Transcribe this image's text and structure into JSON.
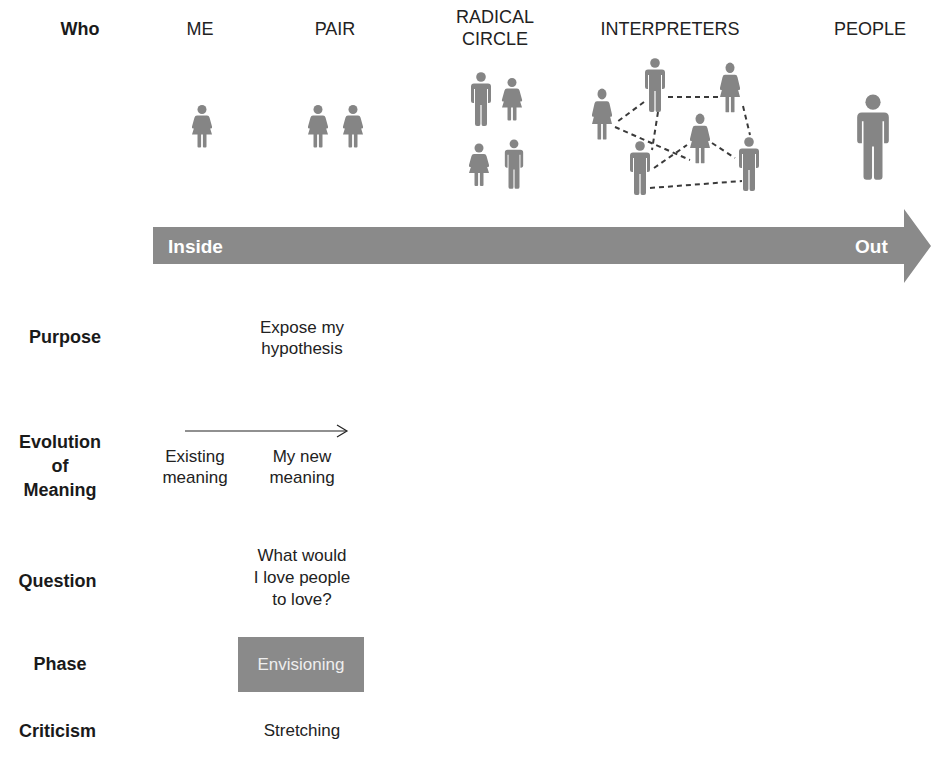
{
  "colors": {
    "figure": "#858585",
    "arrow": "#8a8a8a",
    "phase_box": "#8a8a8a",
    "text": "#1a1a1a"
  },
  "header": {
    "row_label": "Who",
    "columns": [
      {
        "id": "me",
        "label": "ME",
        "figures": [
          "woman"
        ]
      },
      {
        "id": "pair",
        "label": "PAIR",
        "figures": [
          "woman",
          "woman"
        ]
      },
      {
        "id": "radical-circle",
        "label_line1": "RADICAL",
        "label_line2": "CIRCLE",
        "figures": [
          "man",
          "woman",
          "woman",
          "man"
        ]
      },
      {
        "id": "interpreters",
        "label": "INTERPRETERS",
        "figures": [
          "woman",
          "man",
          "woman",
          "woman",
          "man",
          "man"
        ],
        "connections": "dashed network"
      },
      {
        "id": "people",
        "label": "PEOPLE",
        "figures": [
          "large-man"
        ]
      }
    ]
  },
  "arrow": {
    "start_label": "Inside",
    "end_label": "Out"
  },
  "rows": {
    "purpose": {
      "label": "Purpose",
      "line1": "Expose my",
      "line2": "hypothesis"
    },
    "evolution": {
      "label_line1": "Evolution",
      "label_line2": "of",
      "label_line3": "Meaning",
      "from_line1": "Existing",
      "from_line2": "meaning",
      "to_line1": "My new",
      "to_line2": "meaning"
    },
    "question": {
      "label": "Question",
      "line1": "What would",
      "line2": "I love people",
      "line3": "to love?"
    },
    "phase": {
      "label": "Phase",
      "value": "Envisioning"
    },
    "criticism": {
      "label": "Criticism",
      "value": "Stretching"
    }
  }
}
